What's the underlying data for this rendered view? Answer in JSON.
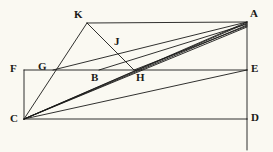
{
  "figure": {
    "background_color": "#faf9f2",
    "stroke_color": "#1a1a18",
    "stroke_width": 0.9,
    "width": 273,
    "height": 152
  },
  "points": {
    "A": {
      "label": "A",
      "x": 247,
      "y": 22,
      "label_x": 250,
      "label_y": 8
    },
    "B": {
      "label": "B",
      "x": 99,
      "y": 70,
      "label_x": 91,
      "label_y": 72
    },
    "C": {
      "label": "C",
      "x": 24,
      "y": 119,
      "label_x": 10,
      "label_y": 113
    },
    "D": {
      "label": "D",
      "x": 247,
      "y": 119,
      "label_x": 251,
      "label_y": 112
    },
    "E": {
      "label": "E",
      "x": 247,
      "y": 70,
      "label_x": 251,
      "label_y": 63
    },
    "F": {
      "label": "F",
      "x": 24,
      "y": 70,
      "label_x": 10,
      "label_y": 63
    },
    "G": {
      "label": "G",
      "x": 53,
      "y": 70,
      "label_x": 38,
      "label_y": 61
    },
    "H": {
      "label": "H",
      "x": 134,
      "y": 70,
      "label_x": 136,
      "label_y": 72
    },
    "J": {
      "label": "J",
      "x": 116,
      "y": 50,
      "label_x": 114,
      "label_y": 36
    },
    "K": {
      "label": "K",
      "x": 87,
      "y": 23,
      "label_x": 74,
      "label_y": 9
    }
  },
  "segments": [
    {
      "name": "segment-K-A",
      "from": "K",
      "to": "A"
    },
    {
      "name": "segment-A-E",
      "from": "A",
      "to": "E"
    },
    {
      "name": "segment-E-D",
      "from": "E",
      "to": "D"
    },
    {
      "name": "segment-F-E",
      "from": "F",
      "to": "E"
    },
    {
      "name": "segment-F-C",
      "from": "F",
      "to": "C"
    },
    {
      "name": "segment-C-D",
      "from": "C",
      "to": "D"
    },
    {
      "name": "segment-K-C",
      "from": "K",
      "to": "C"
    },
    {
      "name": "segment-K-H",
      "from": "K",
      "to": "H"
    },
    {
      "name": "segment-C-A",
      "from": "C",
      "to": "A"
    },
    {
      "name": "segment-G-A",
      "from": "G",
      "to": "A"
    },
    {
      "name": "segment-B-A",
      "from": "B",
      "to": "A"
    },
    {
      "name": "segment-H-A",
      "from": "H",
      "to": "A"
    }
  ],
  "fan_lines_from_C": [
    {
      "name": "ray-C-to-A-upper",
      "to_x": 247,
      "to_y": 22
    },
    {
      "name": "ray-C-through-J",
      "to_x": 247,
      "to_y": 24
    },
    {
      "name": "ray-C-through-B",
      "to_x": 247,
      "to_y": 26
    },
    {
      "name": "ray-C-through-H",
      "to_x": 247,
      "to_y": 28
    },
    {
      "name": "ray-C-to-E",
      "to_x": 247,
      "to_y": 70
    }
  ],
  "labels_order": [
    "K",
    "A",
    "J",
    "F",
    "G",
    "E",
    "B",
    "H",
    "C",
    "D"
  ]
}
